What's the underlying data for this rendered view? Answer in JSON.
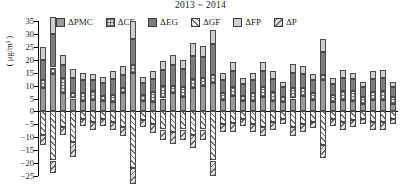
{
  "chart": {
    "title": "2013 ~ 2014",
    "ylabel": "( μg/m³ )"
  },
  "legend": [
    {
      "key": "pmc",
      "label": "ΔPMC",
      "swatch": "solid-gray"
    },
    {
      "key": "ce",
      "label": "ΔCE",
      "swatch": "cross-hatch"
    },
    {
      "key": "eg",
      "label": "ΔEG",
      "swatch": "solid-dark-gray"
    },
    {
      "key": "gf",
      "label": "ΔGF",
      "swatch": "diagonal-hatch-up"
    },
    {
      "key": "fp",
      "label": "ΔFP",
      "swatch": "light-gray"
    },
    {
      "key": "p",
      "label": "ΔP",
      "swatch": "diagonal-hatch-down"
    }
  ],
  "chart_data": {
    "type": "bar",
    "subtype": "stacked-diverging",
    "title": "2013 ~ 2014",
    "xlabel": "",
    "ylabel": "( μg/m³ )",
    "ylim": [
      -25,
      35
    ],
    "yticks": [
      35,
      30,
      25,
      20,
      15,
      10,
      5,
      0,
      -5,
      -10,
      -15,
      -20,
      -25
    ],
    "grid": false,
    "legend_position": "top",
    "categories": [
      "1",
      "2",
      "3",
      "4",
      "5",
      "6",
      "7",
      "8",
      "9",
      "10",
      "11",
      "12",
      "13",
      "14",
      "15",
      "16",
      "17",
      "18",
      "19",
      "20",
      "21",
      "22",
      "23",
      "24",
      "25",
      "26",
      "27",
      "28",
      "29",
      "30",
      "31",
      "32",
      "33",
      "34",
      "35",
      "36"
    ],
    "series": [
      {
        "name": "ΔPMC",
        "values": [
          9.0,
          14.5,
          7.0,
          5.0,
          4.0,
          4.5,
          4.0,
          3.5,
          7.0,
          15.0,
          4.0,
          3.5,
          5.0,
          7.0,
          5.5,
          9.0,
          10.0,
          11.0,
          4.5,
          6.0,
          4.0,
          4.0,
          5.5,
          4.0,
          3.5,
          5.0,
          6.0,
          4.5,
          12.0,
          3.5,
          4.5,
          4.0,
          3.0,
          4.5,
          4.5,
          3.0
        ]
      },
      {
        "name": "ΔCE",
        "values": [
          3.0,
          2.5,
          6.0,
          2.0,
          3.0,
          3.5,
          2.0,
          3.0,
          2.0,
          3.0,
          2.5,
          4.0,
          5.0,
          3.0,
          4.0,
          3.5,
          3.0,
          3.0,
          2.5,
          3.5,
          2.0,
          3.0,
          4.0,
          3.5,
          2.0,
          4.0,
          3.0,
          2.5,
          2.0,
          3.0,
          3.5,
          4.0,
          2.5,
          3.0,
          3.5,
          2.5
        ]
      },
      {
        "name": "ΔEG",
        "values": [
          8.0,
          13.0,
          5.0,
          6.0,
          5.0,
          4.0,
          5.0,
          6.0,
          5.0,
          10.0,
          4.5,
          5.0,
          6.0,
          8.0,
          7.0,
          9.0,
          8.0,
          12.0,
          5.0,
          6.0,
          4.5,
          5.0,
          6.0,
          5.0,
          4.0,
          6.0,
          5.5,
          5.0,
          9.0,
          4.0,
          5.0,
          4.5,
          4.0,
          5.0,
          5.0,
          4.0
        ]
      },
      {
        "name": "ΔGF",
        "values": [
          -9.0,
          -19.0,
          -6.0,
          -12.0,
          -3.0,
          -4.0,
          -3.0,
          -4.0,
          -6.0,
          -22.0,
          -3.5,
          -5.0,
          -7.0,
          -8.0,
          -7.0,
          -9.0,
          -7.0,
          -19.0,
          -5.0,
          -4.5,
          -3.0,
          -5.0,
          -6.0,
          -4.0,
          -3.0,
          -6.0,
          -5.0,
          -4.0,
          -13.0,
          -3.0,
          -4.0,
          -3.5,
          -3.0,
          -4.0,
          -4.0,
          -3.0
        ]
      },
      {
        "name": "ΔFP",
        "values": [
          5.0,
          6.5,
          4.0,
          3.5,
          3.0,
          2.5,
          2.5,
          3.0,
          3.5,
          7.0,
          2.5,
          3.0,
          3.5,
          4.0,
          3.5,
          5.0,
          4.5,
          5.5,
          3.0,
          3.5,
          2.5,
          3.0,
          3.5,
          3.0,
          2.0,
          3.5,
          3.0,
          2.5,
          5.0,
          2.5,
          3.0,
          2.5,
          2.0,
          3.0,
          3.0,
          2.0
        ]
      },
      {
        "name": "ΔP",
        "values": [
          -4.0,
          -5.0,
          -3.0,
          -5.5,
          -2.5,
          -3.0,
          -2.5,
          -3.0,
          -3.5,
          -6.0,
          -2.5,
          -3.5,
          -4.0,
          -4.5,
          -4.0,
          -5.0,
          -4.0,
          -6.0,
          -3.0,
          -3.5,
          -2.5,
          -3.0,
          -3.5,
          -3.0,
          -2.0,
          -3.5,
          -3.0,
          -2.5,
          -5.0,
          -2.5,
          -3.0,
          -2.5,
          -2.0,
          -3.0,
          -3.0,
          -2.0
        ]
      }
    ]
  }
}
